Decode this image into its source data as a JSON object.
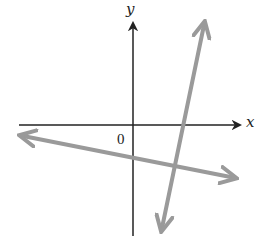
{
  "diagram": {
    "type": "coordinate-plane-with-lines",
    "axes": {
      "x_label": "x",
      "y_label": "y",
      "origin_label": "0",
      "color": "#222222"
    },
    "lines": [
      {
        "name": "steep-line",
        "description": "Steep positive-slope line crossing the positive x-axis, with arrows at both ends",
        "color": "#9a9a9a"
      },
      {
        "name": "shallow-line",
        "description": "Shallow negative-slope line with negative y-intercept, with arrows at both ends",
        "color": "#9a9a9a"
      }
    ]
  }
}
